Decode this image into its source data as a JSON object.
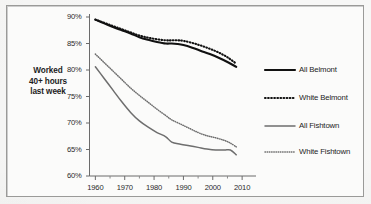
{
  "figure": {
    "background_color": "#f7f7f6",
    "frame_color": "#9a9a98",
    "plot_background": "#fbfbfa"
  },
  "axis_title": {
    "line1": "Worked",
    "line2": "40+ hours",
    "line3": "last week"
  },
  "chart_data": {
    "type": "line",
    "title": "",
    "subtitle": "",
    "xlabel": "",
    "ylabel": "Worked 40+ hours last week",
    "xlim": [
      1958,
      2012
    ],
    "ylim": [
      60,
      90
    ],
    "xticks": [
      1960,
      1970,
      1980,
      1990,
      2000,
      2010
    ],
    "xtick_labels": [
      "1960",
      "1970",
      "1980",
      "1990",
      "2000",
      "2010"
    ],
    "minor_xticks": [
      1965,
      1975,
      1985,
      1995,
      2005
    ],
    "yticks": [
      60,
      65,
      70,
      75,
      80,
      85,
      90
    ],
    "ytick_labels": [
      "60%",
      "65%",
      "70%",
      "75%",
      "80%",
      "85%",
      "90%"
    ],
    "grid": false,
    "legend_position": "right",
    "y_unit": "percent",
    "series": [
      {
        "name": "All Belmont",
        "style": "solid",
        "color": "#111111",
        "width": 2.1,
        "x": [
          1960,
          1963,
          1966,
          1969,
          1972,
          1975,
          1978,
          1981,
          1984,
          1986,
          1988,
          1990,
          1993,
          1996,
          1999,
          2002,
          2005,
          2008
        ],
        "values": [
          89.5,
          88.8,
          88.1,
          87.5,
          86.9,
          86.2,
          85.7,
          85.3,
          85.0,
          85.0,
          84.9,
          84.7,
          84.2,
          83.6,
          83.0,
          82.3,
          81.5,
          80.6
        ]
      },
      {
        "name": "White Belmont",
        "style": "dotted",
        "color": "#111111",
        "width": 2.1,
        "x": [
          1960,
          1963,
          1966,
          1969,
          1972,
          1975,
          1978,
          1981,
          1984,
          1986,
          1988,
          1990,
          1993,
          1996,
          1999,
          2002,
          2005,
          2008
        ],
        "values": [
          89.5,
          88.9,
          88.3,
          87.7,
          87.1,
          86.5,
          86.1,
          85.8,
          85.6,
          85.6,
          85.6,
          85.5,
          85.1,
          84.6,
          84.0,
          83.3,
          82.4,
          81.2
        ]
      },
      {
        "name": "All Fishtown",
        "style": "solid",
        "color": "#6e6e6e",
        "width": 1.5,
        "x": [
          1960,
          1963,
          1966,
          1969,
          1972,
          1975,
          1978,
          1981,
          1984,
          1986,
          1989,
          1992,
          1995,
          1998,
          2001,
          2004,
          2006,
          2008
        ],
        "values": [
          80.6,
          78.4,
          76.2,
          74.0,
          72.0,
          70.4,
          69.2,
          68.2,
          67.4,
          66.4,
          66.0,
          65.7,
          65.4,
          65.1,
          64.9,
          64.9,
          64.9,
          64.0
        ]
      },
      {
        "name": "White Fishtown",
        "style": "dotted",
        "color": "#6e6e6e",
        "width": 1.5,
        "x": [
          1960,
          1963,
          1966,
          1969,
          1972,
          1975,
          1978,
          1981,
          1984,
          1986,
          1989,
          1992,
          1995,
          1998,
          2001,
          2004,
          2006,
          2008
        ],
        "values": [
          83.0,
          81.4,
          79.8,
          78.2,
          76.6,
          75.2,
          73.9,
          72.6,
          71.4,
          70.6,
          69.8,
          69.0,
          68.2,
          67.6,
          67.2,
          66.7,
          66.2,
          65.5
        ]
      }
    ],
    "legend": [
      {
        "label": "All Belmont",
        "style": "solid",
        "color": "#111111",
        "width": 2.1
      },
      {
        "label": "White Belmont",
        "style": "dotted",
        "color": "#111111",
        "width": 2.1
      },
      {
        "label": "All Fishtown",
        "style": "solid",
        "color": "#6e6e6e",
        "width": 1.5
      },
      {
        "label": "White Fishtown",
        "style": "dotted",
        "color": "#6e6e6e",
        "width": 1.5
      }
    ]
  }
}
